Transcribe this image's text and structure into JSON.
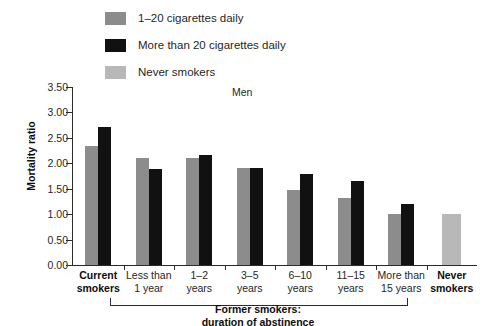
{
  "legend": {
    "items": [
      {
        "label": "1–20 cigarettes daily",
        "color": "#8c8c8c",
        "key": "low"
      },
      {
        "label": "More than 20 cigarettes daily",
        "color": "#111111",
        "key": "high"
      },
      {
        "label": "Never smokers",
        "color": "#b8b8b8",
        "key": "never"
      }
    ]
  },
  "axis": {
    "ylabel": "Mortality ratio",
    "yticks": [
      "0.00",
      "0.50",
      "1.00",
      "1.50",
      "2.00",
      "2.50",
      "3.00",
      "3.50"
    ]
  },
  "bracket": {
    "line1": "Former smokers:",
    "line2": "duration of abstinence"
  },
  "chart_data": {
    "type": "bar",
    "title": "Men",
    "xlabel": "",
    "ylabel": "Mortality ratio",
    "ylim": [
      0.0,
      3.5
    ],
    "ytick_step": 0.5,
    "grid": false,
    "legend_position": "top",
    "categories": [
      "Current smokers",
      "Less than 1 year",
      "1–2 years",
      "3–5 years",
      "6–10 years",
      "11–15 years",
      "More than 15 years",
      "Never smokers"
    ],
    "category_lines": [
      [
        "Current",
        "smokers"
      ],
      [
        "Less than",
        "1 year"
      ],
      [
        "1–2",
        "years"
      ],
      [
        "3–5",
        "years"
      ],
      [
        "6–10",
        "years"
      ],
      [
        "11–15",
        "years"
      ],
      [
        "More than",
        "15 years"
      ],
      [
        "Never",
        "smokers"
      ]
    ],
    "category_bold": [
      true,
      false,
      false,
      false,
      false,
      false,
      false,
      true
    ],
    "series": [
      {
        "name": "1–20 cigarettes daily",
        "color": "#8c8c8c",
        "values": [
          2.35,
          2.1,
          2.1,
          1.9,
          1.48,
          1.32,
          1.0,
          null
        ]
      },
      {
        "name": "More than 20 cigarettes daily",
        "color": "#111111",
        "values": [
          2.72,
          1.88,
          2.16,
          1.9,
          1.78,
          1.65,
          1.2,
          null
        ]
      },
      {
        "name": "Never smokers",
        "color": "#b8b8b8",
        "values": [
          null,
          null,
          null,
          null,
          null,
          null,
          null,
          1.0
        ]
      }
    ]
  }
}
